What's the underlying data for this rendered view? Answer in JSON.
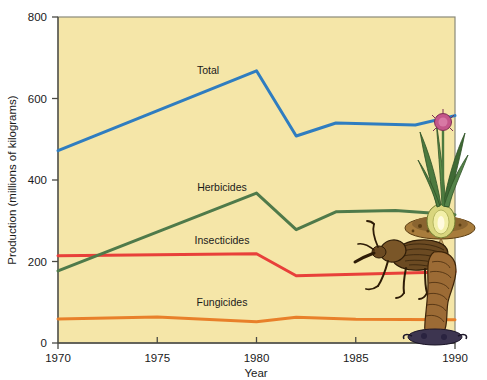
{
  "figure": {
    "background_color": "#ffffff",
    "plot_background_color": "#f5e6a8",
    "plot_border_color": "#8a8a7a"
  },
  "axes": {
    "y_title": "Production (millions of kilograms)",
    "x_title": "Year",
    "y_ticks": [
      "0",
      "200",
      "400",
      "600",
      "800"
    ],
    "x_ticks": [
      "1970",
      "1975",
      "1980",
      "1985",
      "1990"
    ]
  },
  "series_labels": {
    "total": "Total",
    "herbicides": "Herbicides",
    "insecticides": "Insecticides",
    "fungicides": "Fungicides"
  },
  "chart_data": {
    "type": "line",
    "title": "",
    "xlabel": "Year",
    "ylabel": "Production (millions of kilograms)",
    "xlim": [
      1970,
      1990
    ],
    "ylim": [
      0,
      800
    ],
    "xticks": [
      1970,
      1975,
      1980,
      1985,
      1990
    ],
    "yticks": [
      0,
      200,
      400,
      600,
      800
    ],
    "grid": false,
    "legend": "inline-labels",
    "series": [
      {
        "name": "Total",
        "color": "#2f7dc0",
        "x": [
          1970,
          1980,
          1982,
          1984,
          1988,
          1990
        ],
        "values": [
          472,
          668,
          508,
          540,
          535,
          558
        ]
      },
      {
        "name": "Herbicides",
        "color": "#4f7a4a",
        "x": [
          1970,
          1980,
          1982,
          1984,
          1987,
          1990
        ],
        "values": [
          177,
          368,
          278,
          322,
          325,
          315
        ]
      },
      {
        "name": "Insecticides",
        "color": "#e8403a",
        "x": [
          1970,
          1980,
          1982,
          1990
        ],
        "values": [
          214,
          219,
          165,
          175
        ]
      },
      {
        "name": "Fungicides",
        "color": "#e8802a",
        "x": [
          1970,
          1975,
          1980,
          1982,
          1985,
          1990
        ],
        "values": [
          59,
          64,
          52,
          63,
          58,
          57
        ]
      }
    ]
  },
  "illustration": {
    "plant_name": "onion-plant-illustration",
    "insect_name": "weevil-illustration",
    "flower_color": "#c4568a",
    "leaf_color": "#4c7a3f",
    "bulb_color": "#e8e07a",
    "soil_color": "#9c7a3a",
    "insect_body_color": "#6b4a22",
    "larva_color": "#9c6b35"
  }
}
